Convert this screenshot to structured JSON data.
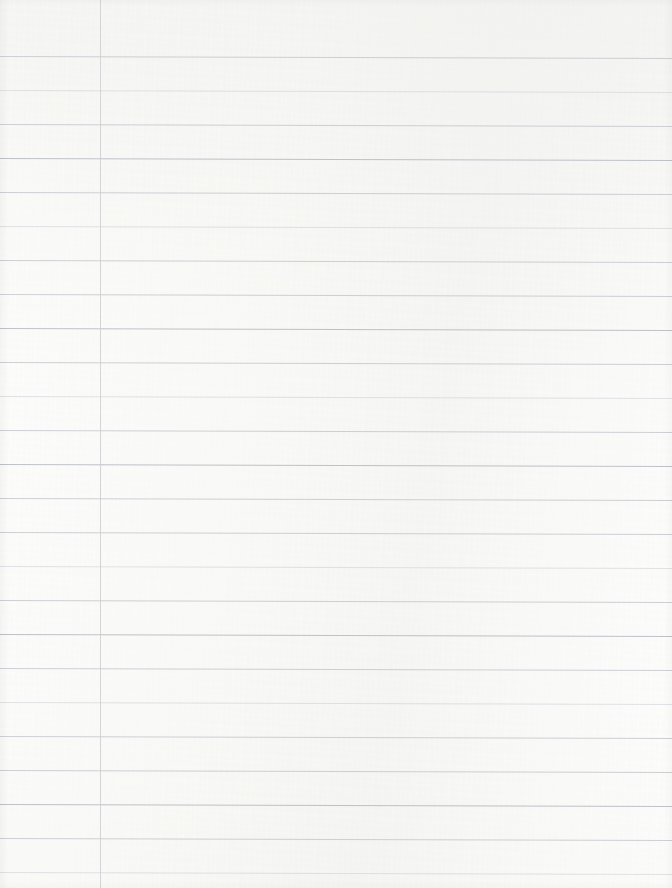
{
  "document": {
    "title": "Blank Ruled Notebook Paper",
    "kind": "scanned-paper-sheet",
    "content_text": "",
    "page_width_px": 672,
    "page_height_px": 888,
    "background_color": "#fefefd",
    "paper_tint_color": "#f2f2ef",
    "has_handwriting": false,
    "has_printed_text": false
  },
  "ruling": {
    "style": "college-ruled",
    "rule_color": "#b9bcc2",
    "rule_thickness_px": 1,
    "rule_spacing_px": 34,
    "first_rule_y_px": 56,
    "rule_count": 25,
    "rule_left_x_px": 0,
    "rule_right_x_px": 671,
    "rule_slight_tilt_deg": 0.18,
    "rule_y_positions": [
      56,
      90,
      124,
      158,
      192,
      226,
      260,
      294,
      328,
      362,
      396,
      430,
      464,
      498,
      532,
      566,
      600,
      634,
      668,
      702,
      736,
      770,
      804,
      838,
      872
    ],
    "rule_opacity_pattern": [
      "normal",
      "faint",
      "normal",
      "darker",
      "normal",
      "faint",
      "normal",
      "normal",
      "darker",
      "normal",
      "faint",
      "normal",
      "darker",
      "normal",
      "normal",
      "faint",
      "normal",
      "darker",
      "normal",
      "faint",
      "normal",
      "normal",
      "darker",
      "normal",
      "faint"
    ]
  },
  "margin": {
    "present": true,
    "orientation": "vertical",
    "x_px": 100,
    "top_y_px": 0,
    "bottom_y_px": 888,
    "color": "#c2c3c8",
    "thickness_px": 1,
    "label": "left-margin-rule"
  },
  "holes": {
    "present": false,
    "count": 0
  },
  "edges": {
    "top_shadow": false,
    "left_shadow": true,
    "right_shadow": true,
    "bottom_shadow": true,
    "shadow_color": "#000000"
  },
  "scan_artifacts": {
    "top_right_tint": "#e9e9e6",
    "mottling_visible": true,
    "skew_deg": 0.18
  }
}
